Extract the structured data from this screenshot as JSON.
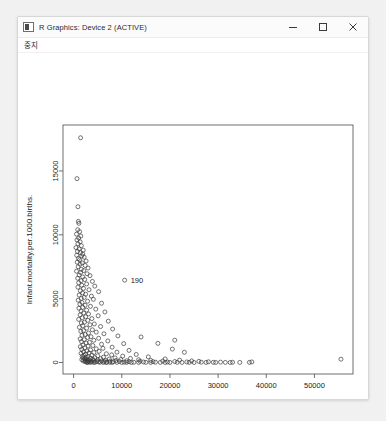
{
  "window": {
    "title": "R Graphics: Device 2 (ACTIVE)",
    "icon": "r-graphics-icon",
    "controls": {
      "minimize": "minimize-icon",
      "maximize": "maximize-icon",
      "close": "close-icon"
    }
  },
  "menubar": {
    "items": [
      {
        "label": "중지",
        "name": "menu-stop"
      }
    ]
  },
  "chart_data": {
    "type": "scatter",
    "title": "",
    "xlabel": "GDP....per.capita.",
    "ylabel": "Infant.mortality.per.1000.births.",
    "xlim": [
      -2200,
      58000
    ],
    "ylim": [
      -900,
      18600
    ],
    "xticks": [
      0,
      10000,
      20000,
      30000,
      40000,
      50000
    ],
    "yticks": [
      0,
      5000,
      10000,
      15000
    ],
    "grid": false,
    "marker": "open-circle",
    "marker_color": "#3a3a3a",
    "annotations": [
      {
        "text": "190",
        "x": 10600,
        "y": 6450
      }
    ],
    "points": [
      [
        1450,
        17600
      ],
      [
        700,
        14400
      ],
      [
        900,
        12200
      ],
      [
        1000,
        11050
      ],
      [
        1100,
        10900
      ],
      [
        850,
        10400
      ],
      [
        1250,
        10250
      ],
      [
        600,
        10050
      ],
      [
        1500,
        9900
      ],
      [
        1050,
        9750
      ],
      [
        700,
        9600
      ],
      [
        1350,
        9450
      ],
      [
        900,
        9300
      ],
      [
        1600,
        9150
      ],
      [
        500,
        9000
      ],
      [
        1150,
        8900
      ],
      [
        2000,
        8800
      ],
      [
        800,
        8700
      ],
      [
        1400,
        8600
      ],
      [
        1900,
        8500
      ],
      [
        650,
        8400
      ],
      [
        1700,
        8350
      ],
      [
        2200,
        8250
      ],
      [
        1000,
        8150
      ],
      [
        1250,
        8050
      ],
      [
        2600,
        7950
      ],
      [
        750,
        7850
      ],
      [
        1800,
        7800
      ],
      [
        1350,
        7700
      ],
      [
        2400,
        7600
      ],
      [
        950,
        7500
      ],
      [
        3000,
        7400
      ],
      [
        1600,
        7300
      ],
      [
        2100,
        7200
      ],
      [
        600,
        7150
      ],
      [
        1450,
        7050
      ],
      [
        2800,
        6950
      ],
      [
        1150,
        6850
      ],
      [
        3400,
        6800
      ],
      [
        1900,
        6700
      ],
      [
        850,
        6600
      ],
      [
        2300,
        6500
      ],
      [
        1550,
        6400
      ],
      [
        3900,
        6350
      ],
      [
        1050,
        6250
      ],
      [
        2700,
        6150
      ],
      [
        1700,
        6050
      ],
      [
        4400,
        5980
      ],
      [
        900,
        5900
      ],
      [
        2050,
        5800
      ],
      [
        3200,
        5700
      ],
      [
        1400,
        5620
      ],
      [
        5200,
        5550
      ],
      [
        1850,
        5450
      ],
      [
        2500,
        5350
      ],
      [
        1150,
        5280
      ],
      [
        3700,
        5200
      ],
      [
        2200,
        5100
      ],
      [
        1600,
        5020
      ],
      [
        4100,
        4950
      ],
      [
        950,
        4880
      ],
      [
        2900,
        4800
      ],
      [
        1750,
        4700
      ],
      [
        5800,
        4640
      ],
      [
        1300,
        4560
      ],
      [
        2400,
        4480
      ],
      [
        3500,
        4400
      ],
      [
        1900,
        4320
      ],
      [
        1100,
        4250
      ],
      [
        4600,
        4180
      ],
      [
        2700,
        4100
      ],
      [
        1550,
        4030
      ],
      [
        6500,
        3960
      ],
      [
        2100,
        3880
      ],
      [
        3100,
        3800
      ],
      [
        1350,
        3730
      ],
      [
        5100,
        3660
      ],
      [
        2500,
        3580
      ],
      [
        1800,
        3510
      ],
      [
        3800,
        3440
      ],
      [
        1050,
        3380
      ],
      [
        2950,
        3300
      ],
      [
        7200,
        3240
      ],
      [
        2250,
        3160
      ],
      [
        1600,
        3100
      ],
      [
        4300,
        3020
      ],
      [
        3400,
        2950
      ],
      [
        1900,
        2880
      ],
      [
        5600,
        2820
      ],
      [
        1200,
        2760
      ],
      [
        2700,
        2690
      ],
      [
        8100,
        2620
      ],
      [
        3900,
        2560
      ],
      [
        2050,
        2500
      ],
      [
        1500,
        2440
      ],
      [
        4700,
        2380
      ],
      [
        3100,
        2310
      ],
      [
        6300,
        2250
      ],
      [
        2400,
        2190
      ],
      [
        1750,
        2130
      ],
      [
        9200,
        2080
      ],
      [
        3600,
        2020
      ],
      [
        2900,
        1960
      ],
      [
        5200,
        1900
      ],
      [
        1350,
        1850
      ],
      [
        2200,
        1790
      ],
      [
        4200,
        1740
      ],
      [
        7100,
        1690
      ],
      [
        1650,
        1630
      ],
      [
        3300,
        1580
      ],
      [
        2600,
        1530
      ],
      [
        10400,
        1480
      ],
      [
        5800,
        1430
      ],
      [
        1950,
        1380
      ],
      [
        4000,
        1330
      ],
      [
        3000,
        1290
      ],
      [
        1400,
        1240
      ],
      [
        8000,
        1200
      ],
      [
        2350,
        1150
      ],
      [
        6100,
        1110
      ],
      [
        4700,
        1070
      ],
      [
        1700,
        1030
      ],
      [
        3500,
        990
      ],
      [
        11500,
        950
      ],
      [
        2750,
        910
      ],
      [
        5300,
        880
      ],
      [
        2050,
        840
      ],
      [
        9000,
        810
      ],
      [
        4200,
        780
      ],
      [
        3200,
        745
      ],
      [
        1550,
        715
      ],
      [
        6800,
        685
      ],
      [
        2500,
        655
      ],
      [
        13000,
        630
      ],
      [
        7900,
        600
      ],
      [
        3800,
        575
      ],
      [
        2200,
        550
      ],
      [
        5000,
        525
      ],
      [
        10200,
        500
      ],
      [
        1800,
        480
      ],
      [
        3000,
        460
      ],
      [
        15500,
        440
      ],
      [
        6200,
        420
      ],
      [
        2600,
        400
      ],
      [
        4400,
        385
      ],
      [
        8600,
        365
      ],
      [
        1950,
        350
      ],
      [
        3500,
        335
      ],
      [
        11800,
        320
      ],
      [
        5600,
        305
      ],
      [
        2300,
        290
      ],
      [
        19000,
        280
      ],
      [
        7400,
        268
      ],
      [
        4000,
        256
      ],
      [
        2800,
        245
      ],
      [
        9800,
        235
      ],
      [
        1700,
        225
      ],
      [
        13500,
        215
      ],
      [
        5000,
        205
      ],
      [
        3300,
        196
      ],
      [
        22000,
        188
      ],
      [
        6600,
        180
      ],
      [
        2400,
        172
      ],
      [
        16000,
        165
      ],
      [
        8800,
        158
      ],
      [
        4200,
        150
      ],
      [
        3000,
        144
      ],
      [
        11000,
        138
      ],
      [
        2000,
        132
      ],
      [
        24500,
        126
      ],
      [
        5800,
        120
      ],
      [
        18500,
        115
      ],
      [
        7600,
        110
      ],
      [
        3600,
        105
      ],
      [
        13800,
        100
      ],
      [
        2600,
        95
      ],
      [
        26000,
        90
      ],
      [
        9500,
        86
      ],
      [
        4800,
        82
      ],
      [
        21000,
        78
      ],
      [
        6400,
        74
      ],
      [
        3100,
        70
      ],
      [
        16500,
        66
      ],
      [
        11500,
        62
      ],
      [
        2400,
        58
      ],
      [
        28000,
        55
      ],
      [
        8200,
        52
      ],
      [
        5200,
        48
      ],
      [
        23500,
        45
      ],
      [
        14500,
        42
      ],
      [
        3800,
        39
      ],
      [
        19500,
        36
      ],
      [
        6900,
        33
      ],
      [
        30500,
        31
      ],
      [
        10500,
        28
      ],
      [
        4500,
        26
      ],
      [
        26500,
        24
      ],
      [
        17000,
        22
      ],
      [
        2900,
        20
      ],
      [
        33000,
        19
      ],
      [
        12500,
        17
      ],
      [
        7500,
        16
      ],
      [
        29000,
        15
      ],
      [
        21500,
        14
      ],
      [
        5500,
        13
      ],
      [
        36500,
        12
      ],
      [
        15000,
        11
      ],
      [
        9000,
        10
      ],
      [
        31500,
        10
      ],
      [
        24000,
        9
      ],
      [
        3400,
        9
      ],
      [
        18000,
        8
      ],
      [
        11000,
        8
      ],
      [
        27500,
        7
      ],
      [
        6200,
        7
      ],
      [
        34500,
        6
      ],
      [
        13500,
        6
      ],
      [
        20000,
        6
      ],
      [
        8000,
        5
      ],
      [
        29500,
        5
      ],
      [
        22500,
        5
      ],
      [
        4200,
        4
      ],
      [
        16000,
        4
      ],
      [
        25000,
        4
      ],
      [
        10000,
        4
      ],
      [
        32500,
        3
      ],
      [
        55500,
        260
      ],
      [
        37000,
        45
      ],
      [
        12000,
        3
      ],
      [
        19000,
        3
      ],
      [
        2800,
        3
      ],
      [
        6800,
        3
      ],
      [
        23000,
        800
      ],
      [
        20500,
        1050
      ],
      [
        17500,
        1500
      ],
      [
        21000,
        1750
      ],
      [
        14000,
        2000
      ],
      [
        10600,
        6450
      ]
    ]
  }
}
